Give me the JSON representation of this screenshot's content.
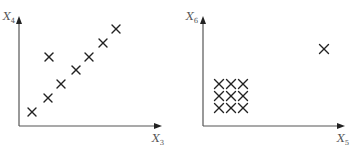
{
  "chart_data": [
    {
      "type": "scatter",
      "title": "",
      "xlabel": "X3",
      "ylabel": "X4",
      "grid": false,
      "marker": "x",
      "points": [
        {
          "x": 1,
          "y": 1
        },
        {
          "x": 2,
          "y": 2
        },
        {
          "x": 3,
          "y": 3
        },
        {
          "x": 4,
          "y": 4
        },
        {
          "x": 5,
          "y": 5
        },
        {
          "x": 6,
          "y": 6
        },
        {
          "x": 7,
          "y": 7
        },
        {
          "x": 2.1,
          "y": 5
        }
      ],
      "annotations": [
        "points lie on a diagonal line with one outlier above the line"
      ]
    },
    {
      "type": "scatter",
      "title": "",
      "xlabel": "X5",
      "ylabel": "X6",
      "grid": false,
      "marker": "x",
      "points": [
        {
          "x": 1,
          "y": 1
        },
        {
          "x": 2,
          "y": 1
        },
        {
          "x": 3,
          "y": 1
        },
        {
          "x": 1,
          "y": 2
        },
        {
          "x": 2,
          "y": 2
        },
        {
          "x": 3,
          "y": 2
        },
        {
          "x": 1,
          "y": 3
        },
        {
          "x": 2,
          "y": 3
        },
        {
          "x": 3,
          "y": 3
        },
        {
          "x": 12,
          "y": 8
        }
      ],
      "annotations": [
        "3x3 cluster near origin with one distant outlier at upper right"
      ]
    }
  ],
  "left": {
    "ylabel_main": "X",
    "ylabel_sub": "4",
    "xlabel_main": "X",
    "xlabel_sub": "3",
    "markers": [
      [
        32,
        112
      ],
      [
        48,
        98
      ],
      [
        61,
        84
      ],
      [
        76,
        70
      ],
      [
        89,
        57
      ],
      [
        103,
        43
      ],
      [
        116,
        29
      ],
      [
        49,
        57
      ]
    ]
  },
  "right": {
    "ylabel_main": "X",
    "ylabel_sub": "6",
    "xlabel_main": "X",
    "xlabel_sub": "5",
    "markers": [
      [
        219,
        84
      ],
      [
        231,
        84
      ],
      [
        243,
        84
      ],
      [
        219,
        96
      ],
      [
        231,
        96
      ],
      [
        243,
        96
      ],
      [
        219,
        108
      ],
      [
        231,
        108
      ],
      [
        243,
        108
      ],
      [
        324,
        49
      ]
    ]
  }
}
